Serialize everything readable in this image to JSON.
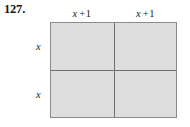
{
  "exercise": {
    "number_label": "127."
  },
  "figure": {
    "type": "area-model-rectangle",
    "columns": [
      {
        "label_var": "x",
        "label_op": "+",
        "label_num": "1"
      },
      {
        "label_var": "x",
        "label_op": "+",
        "label_num": "1"
      }
    ],
    "rows": [
      {
        "label": "x"
      },
      {
        "label": "x"
      }
    ],
    "cells": [
      {
        "id": "r0c0",
        "label": ""
      },
      {
        "id": "r0c1",
        "label": ""
      },
      {
        "id": "r1c0",
        "label": ""
      },
      {
        "id": "r1c1",
        "label": ""
      }
    ],
    "colors": {
      "cell_fill": "#dedede",
      "outer_border": "#8a8a8a",
      "divider": "#6f6f6f",
      "text": "#1c1c1c",
      "background": "#ffffff"
    }
  }
}
